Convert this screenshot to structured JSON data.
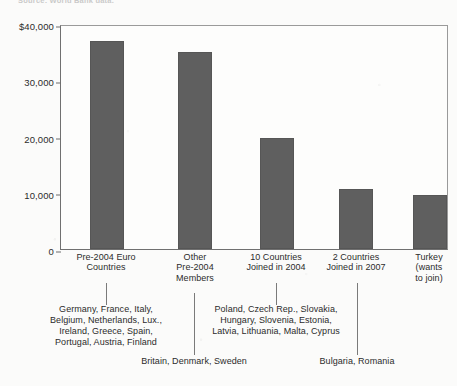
{
  "figure": {
    "source_note": "Source: World Bank data.",
    "bar_color": "#5f5f5f",
    "axis_color": "#707070"
  },
  "chart_data": {
    "type": "bar",
    "title": "",
    "xlabel": "",
    "ylabel": "GDP per capita (2005)",
    "ylim": [
      0,
      40000
    ],
    "yticks": [
      0,
      10000,
      20000,
      30000,
      40000
    ],
    "ytick_labels": [
      "0",
      "10,000",
      "20,000",
      "30,000",
      "$40,000"
    ],
    "grid": false,
    "legend": "none",
    "categories": [
      "Pre-2004 Euro Countries",
      "Other Pre-2004 Members",
      "10 Countries Joined in 2004",
      "2 Countries Joined in 2007",
      "Turkey (wants to join)"
    ],
    "values": [
      37000,
      35000,
      19700,
      10600,
      9600
    ]
  },
  "y_axis": {
    "title": "GDP per capita (2005)",
    "ticks": [
      {
        "label": "$40,000",
        "value": 40000
      },
      {
        "label": "30,000",
        "value": 30000
      },
      {
        "label": "20,000",
        "value": 20000
      },
      {
        "label": "10,000",
        "value": 10000
      },
      {
        "label": "0",
        "value": 0
      }
    ]
  },
  "categories": [
    {
      "label": "Pre-2004 Euro\nCountries",
      "line1": "Pre-2004 Euro",
      "line2": "Countries",
      "line3": ""
    },
    {
      "label": "Other Pre-2004 Members",
      "line1": "Other",
      "line2": "Pre-2004",
      "line3": "Members"
    },
    {
      "label": "10 Countries Joined in 2004",
      "line1": "10 Countries",
      "line2": "Joined in 2004",
      "line3": ""
    },
    {
      "label": "2 Countries Joined in 2007",
      "line1": "2 Countries",
      "line2": "Joined in 2007",
      "line3": ""
    },
    {
      "label": "Turkey (wants to join)",
      "line1": "Turkey",
      "line2": "(wants",
      "line3": "to join)"
    }
  ],
  "notes": {
    "euro_countries": {
      "line1": "Germany, France, Italy,",
      "line2": "Belgium, Netherlands, Lux.,",
      "line3": "Ireland, Greece, Spain,",
      "line4": "Portugal, Austria, Finland"
    },
    "other_pre2004": {
      "line1": "Britain, Denmark, Sweden"
    },
    "joined_2004": {
      "line1": "Poland, Czech Rep., Slovakia,",
      "line2": "Hungary, Slovenia, Estonia,",
      "line3": "Latvia, Lithuania, Malta, Cyprus"
    },
    "joined_2007": {
      "line1": "Bulgaria, Romania"
    }
  }
}
